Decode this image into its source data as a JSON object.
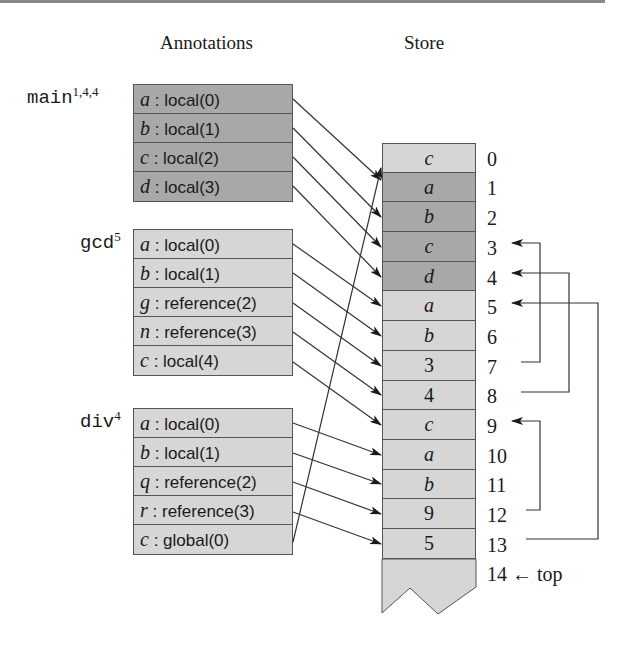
{
  "headings": {
    "annotations": "Annotations",
    "store": "Store"
  },
  "frames": [
    {
      "name": "main",
      "superscript": "1,4,4",
      "shade": "dark",
      "rows": [
        {
          "var": "a",
          "kind": ": local(0)"
        },
        {
          "var": "b",
          "kind": ": local(1)"
        },
        {
          "var": "c",
          "kind": ": local(2)"
        },
        {
          "var": "d",
          "kind": ": local(3)"
        }
      ]
    },
    {
      "name": "gcd",
      "superscript": "5",
      "shade": "light",
      "rows": [
        {
          "var": "a",
          "kind": ": local(0)"
        },
        {
          "var": "b",
          "kind": ": local(1)"
        },
        {
          "var": "g",
          "kind": ": reference(2)"
        },
        {
          "var": "n",
          "kind": ": reference(3)"
        },
        {
          "var": "c",
          "kind": ": local(4)"
        }
      ]
    },
    {
      "name": "div",
      "superscript": "4",
      "shade": "light",
      "rows": [
        {
          "var": "a",
          "kind": ": local(0)"
        },
        {
          "var": "b",
          "kind": ": local(1)"
        },
        {
          "var": "q",
          "kind": ": reference(2)"
        },
        {
          "var": "r",
          "kind": ": reference(3)"
        },
        {
          "var": "c",
          "kind": ": global(0)"
        }
      ]
    }
  ],
  "store": {
    "cells": [
      {
        "index": "0",
        "value": "c",
        "shade": "light",
        "italic": true
      },
      {
        "index": "1",
        "value": "a",
        "shade": "dark",
        "italic": true
      },
      {
        "index": "2",
        "value": "b",
        "shade": "dark",
        "italic": true
      },
      {
        "index": "3",
        "value": "c",
        "shade": "dark",
        "italic": true
      },
      {
        "index": "4",
        "value": "d",
        "shade": "dark",
        "italic": true
      },
      {
        "index": "5",
        "value": "a",
        "shade": "light",
        "italic": true
      },
      {
        "index": "6",
        "value": "b",
        "shade": "light",
        "italic": true
      },
      {
        "index": "7",
        "value": "3",
        "shade": "light",
        "italic": false
      },
      {
        "index": "8",
        "value": "4",
        "shade": "light",
        "italic": false
      },
      {
        "index": "9",
        "value": "c",
        "shade": "light",
        "italic": true
      },
      {
        "index": "10",
        "value": "a",
        "shade": "light",
        "italic": true
      },
      {
        "index": "11",
        "value": "b",
        "shade": "light",
        "italic": true
      },
      {
        "index": "12",
        "value": "9",
        "shade": "light",
        "italic": false
      },
      {
        "index": "13",
        "value": "5",
        "shade": "light",
        "italic": false
      }
    ],
    "top_label": "14 ← top"
  },
  "colors": {
    "dark_cell": "#a8a8a8",
    "light_cell": "#d6d6d6",
    "line": "#333333"
  }
}
